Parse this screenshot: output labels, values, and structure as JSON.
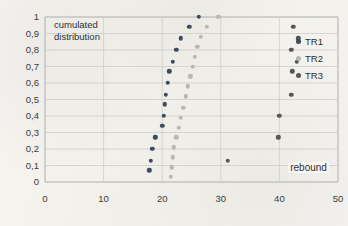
{
  "chart_data": {
    "type": "scatter",
    "title": "cumulated\ndistribution",
    "xlabel": "rebound",
    "ylabel": "",
    "xlim": [
      0,
      50
    ],
    "ylim": [
      0,
      1
    ],
    "grid": true,
    "legend_position": "right",
    "xticks": [
      "0",
      "10",
      "20",
      "30",
      "40",
      "50"
    ],
    "xtick_values": [
      0,
      10,
      20,
      30,
      40,
      50
    ],
    "yticks": [
      "0",
      "0,1",
      "0,2",
      "0,3",
      "0,4",
      "0,5",
      "0,6",
      "0,7",
      "0,8",
      "0,9",
      "1"
    ],
    "ytick_values": [
      0,
      0.1,
      0.2,
      0.3,
      0.4,
      0.5,
      0.6,
      0.7,
      0.8,
      0.9,
      1.0
    ],
    "series": [
      {
        "name": "TR1",
        "color": "#3b4a5e",
        "points": [
          [
            17.8,
            0.07
          ],
          [
            18.1,
            0.13
          ],
          [
            18.3,
            0.2
          ],
          [
            18.8,
            0.27
          ],
          [
            20.0,
            0.34
          ],
          [
            20.3,
            0.4
          ],
          [
            20.4,
            0.47
          ],
          [
            20.6,
            0.53
          ],
          [
            21.0,
            0.6
          ],
          [
            21.2,
            0.67
          ],
          [
            21.8,
            0.73
          ],
          [
            22.4,
            0.8
          ],
          [
            23.2,
            0.87
          ],
          [
            24.6,
            0.94
          ],
          [
            26.2,
            1.0
          ]
        ]
      },
      {
        "name": "TR2",
        "color": "#b7b7b7",
        "points": [
          [
            21.5,
            0.03
          ],
          [
            21.6,
            0.09
          ],
          [
            21.8,
            0.15
          ],
          [
            22.0,
            0.21
          ],
          [
            22.4,
            0.27
          ],
          [
            22.8,
            0.33
          ],
          [
            23.2,
            0.39
          ],
          [
            23.6,
            0.45
          ],
          [
            24.0,
            0.52
          ],
          [
            24.4,
            0.58
          ],
          [
            24.8,
            0.64
          ],
          [
            25.2,
            0.7
          ],
          [
            25.6,
            0.76
          ],
          [
            26.0,
            0.82
          ],
          [
            26.6,
            0.88
          ],
          [
            27.6,
            0.94
          ],
          [
            29.6,
            1.0
          ]
        ]
      },
      {
        "name": "TR3",
        "color": "#565656",
        "points": [
          [
            31.2,
            0.13
          ],
          [
            39.8,
            0.27
          ],
          [
            40.0,
            0.4
          ],
          [
            42.0,
            0.53
          ],
          [
            42.2,
            0.67
          ],
          [
            43.0,
            0.73
          ],
          [
            42.0,
            0.8
          ],
          [
            43.2,
            0.87
          ],
          [
            42.4,
            0.94
          ]
        ]
      }
    ]
  },
  "legend": {
    "items": [
      {
        "label": "TR1",
        "color": "#3b4a5e"
      },
      {
        "label": "TR2",
        "color": "#b7b7b7"
      },
      {
        "label": "TR3",
        "color": "#565656"
      }
    ]
  }
}
